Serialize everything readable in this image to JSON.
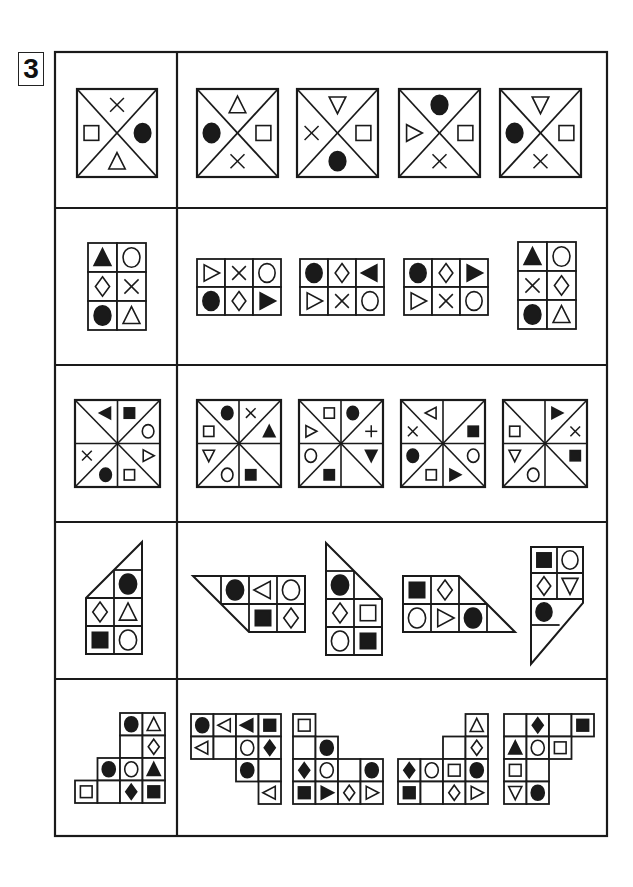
{
  "page": {
    "badge_number": "3"
  },
  "frame": {
    "x": 55,
    "y": 52,
    "w": 552,
    "h": 784,
    "divider_x": 177,
    "row_tops": [
      52,
      208,
      365,
      522,
      679,
      836
    ]
  },
  "colors": {
    "ink": "#1a1a1a",
    "paper": "#ffffff"
  },
  "rows": [
    {
      "id": "row-1",
      "type": "quad",
      "question": {
        "x": 77,
        "y": 89,
        "w": 80,
        "h": 88,
        "top": "x",
        "right": "circle-f",
        "bottom": "tri-up-o",
        "left": "square-o"
      },
      "options": [
        {
          "x": 197,
          "y": 89,
          "w": 81,
          "h": 88,
          "top": "tri-up-o",
          "right": "square-o",
          "bottom": "x",
          "left": "circle-f"
        },
        {
          "x": 297,
          "y": 89,
          "w": 81,
          "h": 88,
          "top": "tri-down-o",
          "right": "square-o",
          "bottom": "circle-f",
          "left": "x"
        },
        {
          "x": 399,
          "y": 89,
          "w": 81,
          "h": 88,
          "top": "circle-f",
          "right": "square-o",
          "bottom": "x",
          "left": "tri-right-o"
        },
        {
          "x": 500,
          "y": 89,
          "w": 81,
          "h": 88,
          "top": "tri-down-o",
          "right": "square-o",
          "bottom": "x",
          "left": "circle-f"
        }
      ]
    },
    {
      "id": "row-2",
      "type": "grid",
      "question": {
        "x": 88,
        "y": 243,
        "cell": 29,
        "cells": [
          [
            0,
            0,
            "tri-up-f"
          ],
          [
            0,
            1,
            "circle-o"
          ],
          [
            1,
            0,
            "diamond-o"
          ],
          [
            1,
            1,
            "x"
          ],
          [
            2,
            0,
            "circle-f"
          ],
          [
            2,
            1,
            "tri-up-o"
          ]
        ]
      },
      "options": [
        {
          "x": 197,
          "y": 259,
          "cell": 28,
          "cells": [
            [
              0,
              0,
              "tri-right-o"
            ],
            [
              0,
              1,
              "x"
            ],
            [
              0,
              2,
              "circle-o"
            ],
            [
              1,
              0,
              "circle-f"
            ],
            [
              1,
              1,
              "diamond-o"
            ],
            [
              1,
              2,
              "tri-right-f"
            ]
          ]
        },
        {
          "x": 300,
          "y": 259,
          "cell": 28,
          "cells": [
            [
              0,
              0,
              "circle-f"
            ],
            [
              0,
              1,
              "diamond-o"
            ],
            [
              0,
              2,
              "tri-left-f"
            ],
            [
              1,
              0,
              "tri-right-o"
            ],
            [
              1,
              1,
              "x"
            ],
            [
              1,
              2,
              "circle-o"
            ]
          ]
        },
        {
          "x": 404,
          "y": 259,
          "cell": 28,
          "cells": [
            [
              0,
              0,
              "circle-f"
            ],
            [
              0,
              1,
              "diamond-o"
            ],
            [
              0,
              2,
              "tri-right-f"
            ],
            [
              1,
              0,
              "tri-right-o"
            ],
            [
              1,
              1,
              "x"
            ],
            [
              1,
              2,
              "circle-o"
            ]
          ]
        },
        {
          "x": 518,
          "y": 242,
          "cell": 29,
          "cells": [
            [
              0,
              0,
              "tri-up-f"
            ],
            [
              0,
              1,
              "circle-o"
            ],
            [
              1,
              0,
              "x"
            ],
            [
              1,
              1,
              "diamond-o"
            ],
            [
              2,
              0,
              "circle-f"
            ],
            [
              2,
              1,
              "tri-up-o"
            ]
          ]
        }
      ]
    },
    {
      "id": "row-3",
      "type": "oct",
      "question": {
        "x": 75,
        "y": 400,
        "w": 85,
        "h": 87,
        "slots": [
          "tri-left-f",
          "square-f",
          "circle-o",
          "tri-right-o",
          "square-o",
          "circle-f",
          "x",
          ""
        ]
      },
      "options": [
        {
          "x": 197,
          "y": 400,
          "w": 84,
          "h": 87,
          "slots": [
            "circle-f",
            "x",
            "tri-up-f",
            "",
            "square-f",
            "circle-o",
            "tri-down-o",
            "square-o"
          ]
        },
        {
          "x": 299,
          "y": 400,
          "w": 84,
          "h": 87,
          "slots": [
            "square-o",
            "circle-f",
            "plus",
            "tri-down-f",
            "",
            "square-f",
            "circle-o",
            "tri-right-o"
          ]
        },
        {
          "x": 401,
          "y": 400,
          "w": 84,
          "h": 87,
          "slots": [
            "tri-left-o",
            "",
            "square-f",
            "circle-o",
            "tri-right-f",
            "square-o",
            "circle-f",
            "x"
          ]
        },
        {
          "x": 503,
          "y": 400,
          "w": 84,
          "h": 87,
          "slots": [
            "",
            "tri-right-f",
            "x",
            "square-f",
            "",
            "circle-o",
            "tri-down-o",
            "square-o"
          ]
        }
      ]
    },
    {
      "id": "row-4",
      "type": "poly",
      "question": {
        "ox": 86,
        "oy": 570,
        "cell": 28,
        "poly": [
          [
            0,
            1
          ],
          [
            2,
            -1
          ],
          [
            2,
            3
          ],
          [
            0,
            3
          ]
        ],
        "lines": [
          [
            [
              1,
              0
            ],
            [
              2,
              0
            ]
          ],
          [
            [
              1,
              0
            ],
            [
              1,
              3
            ]
          ],
          [
            [
              0,
              1
            ],
            [
              2,
              1
            ]
          ],
          [
            [
              0,
              2
            ],
            [
              2,
              2
            ]
          ]
        ],
        "cells": [
          [
            0,
            1,
            "circle-f"
          ],
          [
            1,
            0,
            "diamond-o"
          ],
          [
            1,
            1,
            "tri-up-o"
          ],
          [
            2,
            0,
            "square-f"
          ],
          [
            2,
            1,
            "circle-o"
          ]
        ]
      },
      "options": [
        {
          "ox": 193,
          "oy": 576,
          "cell": 28,
          "poly": [
            [
              0,
              0
            ],
            [
              4,
              0
            ],
            [
              4,
              2
            ],
            [
              2,
              2
            ]
          ],
          "lines": [
            [
              [
                1,
                0
              ],
              [
                1,
                1
              ]
            ],
            [
              [
                2,
                0
              ],
              [
                2,
                2
              ]
            ],
            [
              [
                3,
                0
              ],
              [
                3,
                2
              ]
            ],
            [
              [
                1,
                1
              ],
              [
                4,
                1
              ]
            ]
          ],
          "cells": [
            [
              0,
              1,
              "circle-f"
            ],
            [
              0,
              2,
              "tri-left-o"
            ],
            [
              0,
              3,
              "circle-o"
            ],
            [
              1,
              2,
              "square-f"
            ],
            [
              1,
              3,
              "diamond-o"
            ]
          ]
        },
        {
          "ox": 326,
          "oy": 543,
          "cell": 28,
          "poly": [
            [
              0,
              0
            ],
            [
              2,
              2
            ],
            [
              2,
              4
            ],
            [
              0,
              4
            ]
          ],
          "lines": [
            [
              [
                0,
                1
              ],
              [
                1,
                1
              ]
            ],
            [
              [
                1,
                1
              ],
              [
                1,
                4
              ]
            ],
            [
              [
                0,
                2
              ],
              [
                2,
                2
              ]
            ],
            [
              [
                0,
                3
              ],
              [
                2,
                3
              ]
            ]
          ],
          "cells": [
            [
              1,
              0,
              "circle-f"
            ],
            [
              2,
              0,
              "diamond-o"
            ],
            [
              2,
              1,
              "square-o"
            ],
            [
              3,
              0,
              "circle-o"
            ],
            [
              3,
              1,
              "square-f"
            ]
          ]
        },
        {
          "ox": 403,
          "oy": 576,
          "cell": 28,
          "poly": [
            [
              0,
              0
            ],
            [
              2,
              0
            ],
            [
              4,
              2
            ],
            [
              0,
              2
            ]
          ],
          "lines": [
            [
              [
                1,
                0
              ],
              [
                1,
                2
              ]
            ],
            [
              [
                2,
                0
              ],
              [
                2,
                2
              ]
            ],
            [
              [
                3,
                1
              ],
              [
                3,
                2
              ]
            ],
            [
              [
                0,
                1
              ],
              [
                3,
                1
              ]
            ]
          ],
          "cells": [
            [
              0,
              0,
              "square-f"
            ],
            [
              0,
              1,
              "diamond-o"
            ],
            [
              1,
              0,
              "circle-o"
            ],
            [
              1,
              1,
              "tri-right-o"
            ],
            [
              1,
              2,
              "circle-f"
            ]
          ]
        },
        {
          "ox": 531,
          "oy": 547,
          "cell": 26,
          "poly": [
            [
              0,
              0
            ],
            [
              2,
              0
            ],
            [
              2,
              2.15
            ],
            [
              0,
              4.5
            ]
          ],
          "lines": [
            [
              [
                1,
                0
              ],
              [
                1,
                2
              ]
            ],
            [
              [
                0,
                1
              ],
              [
                2,
                1
              ]
            ],
            [
              [
                0,
                2
              ],
              [
                2,
                2
              ]
            ],
            [
              [
                0,
                3
              ],
              [
                1.1,
                3
              ]
            ]
          ],
          "cells": [
            [
              0,
              0,
              "square-f"
            ],
            [
              0,
              1,
              "circle-o"
            ],
            [
              1,
              0,
              "diamond-o"
            ],
            [
              1,
              1,
              "tri-down-o"
            ],
            [
              2,
              0,
              "circle-f"
            ]
          ]
        }
      ]
    },
    {
      "id": "row-5",
      "type": "cells",
      "question": {
        "x": 75,
        "y": 713,
        "cell": 22.5,
        "cells": [
          [
            0,
            2,
            "circle-f"
          ],
          [
            0,
            3,
            "tri-up-o"
          ],
          [
            1,
            2,
            ""
          ],
          [
            1,
            3,
            "diamond-o"
          ],
          [
            2,
            1,
            "circle-f"
          ],
          [
            2,
            2,
            "circle-o"
          ],
          [
            2,
            3,
            "tri-up-f"
          ],
          [
            3,
            0,
            "square-o"
          ],
          [
            3,
            1,
            ""
          ],
          [
            3,
            2,
            "diamond-f"
          ],
          [
            3,
            3,
            "square-f"
          ]
        ]
      },
      "options": [
        {
          "x": 191,
          "y": 714,
          "cell": 22.5,
          "cells": [
            [
              0,
              0,
              "circle-f"
            ],
            [
              0,
              1,
              "tri-left-o"
            ],
            [
              0,
              2,
              "tri-left-f"
            ],
            [
              0,
              3,
              "square-f"
            ],
            [
              1,
              0,
              "tri-left-o"
            ],
            [
              1,
              1,
              ""
            ],
            [
              1,
              2,
              "circle-o"
            ],
            [
              1,
              3,
              "diamond-f"
            ],
            [
              2,
              2,
              "circle-f"
            ],
            [
              2,
              3,
              ""
            ],
            [
              3,
              3,
              "tri-left-o"
            ]
          ]
        },
        {
          "x": 293,
          "y": 714,
          "cell": 22.5,
          "cells": [
            [
              0,
              0,
              "square-o"
            ],
            [
              1,
              0,
              ""
            ],
            [
              1,
              1,
              "circle-f"
            ],
            [
              2,
              0,
              "diamond-f"
            ],
            [
              2,
              1,
              "circle-o"
            ],
            [
              2,
              2,
              ""
            ],
            [
              2,
              3,
              "circle-f"
            ],
            [
              3,
              0,
              "square-f"
            ],
            [
              3,
              1,
              "tri-right-f"
            ],
            [
              3,
              2,
              "diamond-o"
            ],
            [
              3,
              3,
              "tri-right-o"
            ]
          ]
        },
        {
          "x": 398,
          "y": 714,
          "cell": 22.5,
          "cells": [
            [
              0,
              3,
              "tri-up-o"
            ],
            [
              1,
              2,
              ""
            ],
            [
              1,
              3,
              "diamond-o"
            ],
            [
              2,
              0,
              "diamond-f"
            ],
            [
              2,
              1,
              "circle-o"
            ],
            [
              2,
              2,
              "square-o"
            ],
            [
              2,
              3,
              "circle-f"
            ],
            [
              3,
              0,
              "square-f"
            ],
            [
              3,
              1,
              ""
            ],
            [
              3,
              2,
              "diamond-o"
            ],
            [
              3,
              3,
              "tri-right-o"
            ]
          ]
        },
        {
          "x": 504,
          "y": 714,
          "cell": 22.5,
          "cells": [
            [
              0,
              0,
              ""
            ],
            [
              0,
              1,
              "diamond-f"
            ],
            [
              0,
              2,
              ""
            ],
            [
              0,
              3,
              "square-f"
            ],
            [
              1,
              0,
              "tri-up-f"
            ],
            [
              1,
              1,
              "circle-o"
            ],
            [
              1,
              2,
              "square-o"
            ],
            [
              2,
              0,
              "square-o"
            ],
            [
              2,
              1,
              ""
            ],
            [
              3,
              0,
              "tri-down-o"
            ],
            [
              3,
              1,
              "circle-f"
            ]
          ]
        }
      ]
    }
  ]
}
